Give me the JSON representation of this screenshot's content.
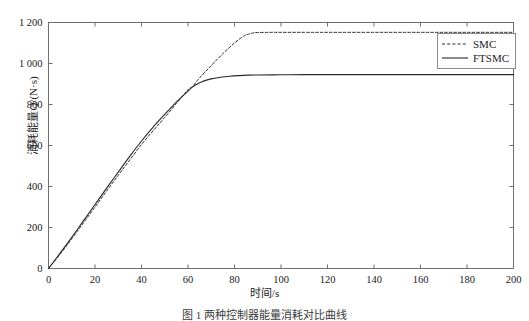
{
  "chart_data": {
    "type": "line",
    "title": "",
    "xlabel": "时间/s",
    "ylabel": "消耗能量Q/(N·s)",
    "xlim": [
      0,
      200
    ],
    "ylim": [
      0,
      1200
    ],
    "xticks": [
      0,
      20,
      40,
      60,
      80,
      100,
      120,
      140,
      160,
      180,
      200
    ],
    "xtick_labels": [
      "0",
      "20",
      "40",
      "60",
      "80",
      "100",
      "120",
      "140",
      "160",
      "180",
      "200"
    ],
    "yticks": [
      0,
      200,
      400,
      600,
      800,
      1000,
      1200
    ],
    "ytick_labels": [
      "0",
      "200",
      "400",
      "600",
      "800",
      "1 000",
      "1 200"
    ],
    "grid": false,
    "legend_position": "upper right",
    "series": [
      {
        "name": "SMC",
        "style": "dashed",
        "color": "#2b2b2b",
        "x": [
          0,
          5,
          10,
          15,
          20,
          25,
          30,
          35,
          40,
          45,
          50,
          55,
          60,
          62,
          65,
          70,
          75,
          80,
          84,
          86,
          88,
          90,
          95,
          100,
          110,
          120,
          140,
          160,
          180,
          200
        ],
        "y": [
          0,
          70,
          145,
          222,
          300,
          378,
          455,
          530,
          605,
          672,
          737,
          805,
          872,
          888,
          930,
          990,
          1048,
          1100,
          1134,
          1143,
          1149,
          1151,
          1152,
          1152,
          1152,
          1152,
          1152,
          1152,
          1152,
          1152
        ]
      },
      {
        "name": "FTSMC",
        "style": "solid",
        "color": "#2b2b2b",
        "x": [
          0,
          5,
          10,
          15,
          20,
          25,
          30,
          35,
          40,
          45,
          50,
          55,
          60,
          62,
          64,
          66,
          68,
          70,
          74,
          78,
          82,
          86,
          90,
          100,
          110,
          120,
          140,
          160,
          180,
          200
        ],
        "y": [
          0,
          75,
          152,
          232,
          312,
          392,
          470,
          548,
          622,
          690,
          752,
          812,
          866,
          886,
          900,
          911,
          919,
          925,
          933,
          938,
          941,
          943,
          944,
          945,
          946,
          946,
          946,
          946,
          946,
          946
        ]
      }
    ]
  },
  "legend": {
    "entries": [
      {
        "label": "SMC",
        "style": "dashed"
      },
      {
        "label": "FTSMC",
        "style": "solid"
      }
    ]
  },
  "caption": {
    "text": "图 1  两种控制器能量消耗对比曲线"
  }
}
